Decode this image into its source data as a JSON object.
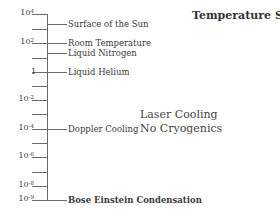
{
  "title": "Temperature Scale",
  "axis": {
    "ticks": [
      {
        "base": "10",
        "exp": "4",
        "y": 14
      },
      {
        "base": "",
        "exp": "",
        "y": 29
      },
      {
        "base": "10",
        "exp": "2",
        "y": 43
      },
      {
        "base": "",
        "exp": "",
        "y": 58
      },
      {
        "base": "1",
        "exp": "",
        "y": 72
      },
      {
        "base": "",
        "exp": "",
        "y": 86
      },
      {
        "base": "10",
        "exp": "-2",
        "y": 100
      },
      {
        "base": "",
        "exp": "",
        "y": 114
      },
      {
        "base": "10",
        "exp": "-4",
        "y": 129
      },
      {
        "base": "",
        "exp": "",
        "y": 143
      },
      {
        "base": "10",
        "exp": "-6",
        "y": 157
      },
      {
        "base": "",
        "exp": "",
        "y": 172
      },
      {
        "base": "10",
        "exp": "-8",
        "y": 186
      },
      {
        "base": "10",
        "exp": "-9",
        "y": 200
      }
    ]
  },
  "events": [
    {
      "label": "Surface of the Sun",
      "y": 24,
      "bold": false
    },
    {
      "label": "Room Temperature",
      "y": 43,
      "bold": false
    },
    {
      "label": "Liquid Nitrogen",
      "y": 53,
      "bold": false
    },
    {
      "label": "Liquid Helium",
      "y": 72,
      "bold": false
    },
    {
      "label": "Doppler Cooling",
      "y": 129,
      "bold": false
    },
    {
      "label": "Bose Einstein Condensation",
      "y": 200,
      "bold": true
    }
  ],
  "note": {
    "line1": "Laser Cooling",
    "line2": "No Cryogenics"
  },
  "labels": {
    "t0": "10",
    "t0e": "4",
    "t2": "10",
    "t2e": "2",
    "t4": "1",
    "t6": "10",
    "t6e": "-2",
    "t8": "10",
    "t8e": "-4",
    "t10": "10",
    "t10e": "-6",
    "t12": "10",
    "t12e": "-8",
    "t13": "10",
    "t13e": "-9"
  }
}
